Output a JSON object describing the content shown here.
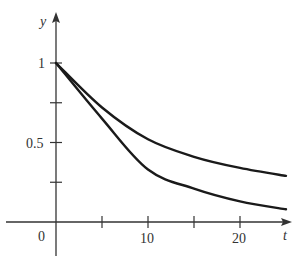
{
  "chart_data": {
    "type": "line",
    "title": "",
    "xlabel": "t",
    "ylabel": "y",
    "xlim": [
      -6,
      25.5
    ],
    "ylim": [
      -0.22,
      1.2
    ],
    "grid": false,
    "legend": null,
    "x_ticks": [
      0,
      5,
      10,
      15,
      20
    ],
    "x_tick_labels": [
      "0",
      "",
      "10",
      "",
      "20"
    ],
    "y_ticks": [
      0.25,
      0.5,
      0.75,
      1
    ],
    "y_tick_labels": [
      "",
      "0.5",
      "",
      "1"
    ],
    "note": "Values read from pixels (approx ±0.03); the figure does not label the curves or give formulas.",
    "series": [
      {
        "name": "upper curve",
        "points": [
          [
            0,
            1.0
          ],
          [
            5,
            0.72
          ],
          [
            10,
            0.52
          ],
          [
            15,
            0.41
          ],
          [
            20,
            0.34
          ],
          [
            25,
            0.29
          ]
        ]
      },
      {
        "name": "lower curve",
        "points": [
          [
            0,
            1.0
          ],
          [
            5,
            0.65
          ],
          [
            10,
            0.33
          ],
          [
            15,
            0.21
          ],
          [
            20,
            0.13
          ],
          [
            25,
            0.08
          ]
        ]
      }
    ]
  },
  "labels": {
    "y_axis": "y",
    "x_axis": "t",
    "origin": "0",
    "y_one": "1",
    "y_half": "0.5",
    "x_ten": "10",
    "x_twenty": "20"
  }
}
